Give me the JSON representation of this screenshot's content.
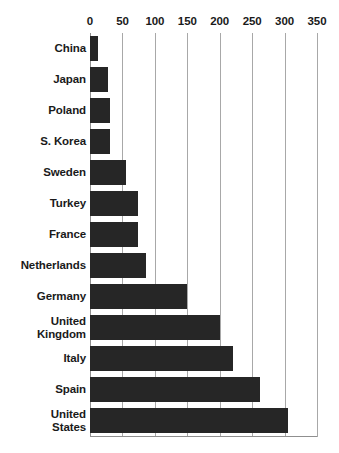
{
  "chart_data": {
    "type": "bar",
    "orientation": "horizontal",
    "title": "",
    "subtitle": "",
    "xlabel": "",
    "ylabel": "",
    "xlim": [
      0,
      350
    ],
    "ylim": null,
    "grid": true,
    "legend": null,
    "legend_position": "none",
    "bar_color": "#262626",
    "gridline_color": "#a8a8a8",
    "axis_color": "#8f8f8f",
    "text_color": "#1a1a1a",
    "xticks": [
      0,
      50,
      100,
      150,
      200,
      250,
      300,
      350
    ],
    "xtick_labels": [
      "0",
      "50",
      "100",
      "150",
      "200",
      "250",
      "300",
      "350"
    ],
    "categories": [
      "China",
      "Japan",
      "Poland",
      "S. Korea",
      "Sweden",
      "Turkey",
      "France",
      "Netherlands",
      "Germany",
      "United Kingdom",
      "Italy",
      "Spain",
      "United States"
    ],
    "category_lines": [
      [
        "China"
      ],
      [
        "Japan"
      ],
      [
        "Poland"
      ],
      [
        "S. Korea"
      ],
      [
        "Sweden"
      ],
      [
        "Turkey"
      ],
      [
        "France"
      ],
      [
        "Netherlands"
      ],
      [
        "Germany"
      ],
      [
        "United",
        "Kingdom"
      ],
      [
        "Italy"
      ],
      [
        "Spain"
      ],
      [
        "United",
        "States"
      ]
    ],
    "values": [
      12,
      28,
      31,
      31,
      56,
      74,
      74,
      86,
      150,
      201,
      220,
      262,
      306
    ],
    "annotations": []
  }
}
